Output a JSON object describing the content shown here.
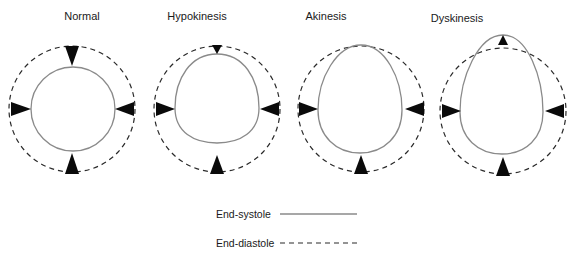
{
  "figure": {
    "panels": [
      {
        "title": "Normal",
        "motion": "normal"
      },
      {
        "title": "Hypokinesis",
        "motion": "reduced inward motion"
      },
      {
        "title": "Akinesis",
        "motion": "no motion at apex"
      },
      {
        "title": "Dyskinesis",
        "motion": "paradoxical outward motion at apex"
      }
    ],
    "legend": {
      "systole_label": "End-systole",
      "diastole_label": "End-diastole"
    },
    "colors": {
      "systole_line": "#8a8a8a",
      "diastole_line": "#2a2a2a",
      "arrow": "#0a0a0a",
      "background": "#ffffff"
    }
  }
}
